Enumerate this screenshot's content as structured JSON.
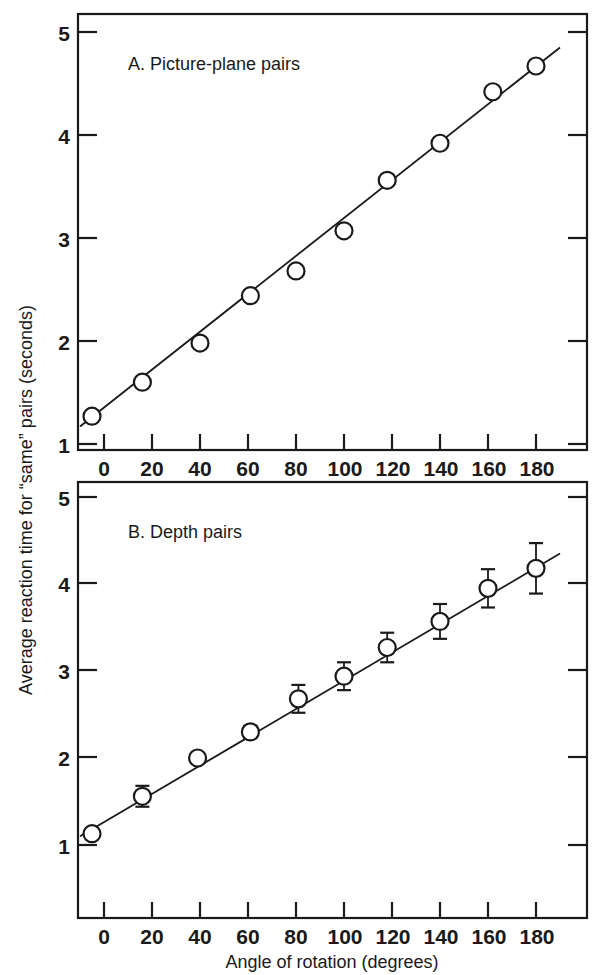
{
  "figure": {
    "background": "#ffffff",
    "ink_color": "#1a1a1a",
    "x_axis_label": "Angle of rotation (degrees)",
    "y_axis_label": "Average reaction time for “same” pairs (seconds)"
  },
  "chart_data": [
    {
      "type": "scatter",
      "panel": "A",
      "title": "A. Picture-plane pairs",
      "xlabel": "Angle of rotation (degrees)",
      "ylabel": "Average reaction time for “same” pairs (seconds)",
      "xlim": [
        -10,
        190
      ],
      "ylim": [
        1,
        5.2
      ],
      "xticks": [
        0,
        20,
        40,
        60,
        80,
        100,
        120,
        140,
        160,
        180
      ],
      "yticks": [
        1,
        2,
        3,
        4,
        5
      ],
      "grid": false,
      "legend": null,
      "marker": "open-circle",
      "has_error_bars": false,
      "x": [
        -5,
        16,
        40,
        61,
        80,
        100,
        118,
        140,
        162,
        180
      ],
      "values": [
        1.27,
        1.6,
        1.98,
        2.44,
        2.68,
        3.07,
        3.56,
        3.92,
        4.42,
        4.67
      ],
      "fit_line": {
        "x0": -10,
        "y0": 1.17,
        "x1": 190,
        "y1": 4.85
      }
    },
    {
      "type": "scatter",
      "panel": "B",
      "title": "B. Depth pairs",
      "xlabel": "Angle of rotation (degrees)",
      "ylabel": "Average reaction time for “same” pairs (seconds)",
      "xlim": [
        -10,
        190
      ],
      "ylim": [
        1,
        5.2
      ],
      "xticks": [
        0,
        20,
        40,
        60,
        80,
        100,
        120,
        140,
        160,
        180
      ],
      "yticks": [
        1,
        2,
        3,
        4,
        5
      ],
      "grid": false,
      "legend": null,
      "marker": "open-circle",
      "has_error_bars": true,
      "x": [
        -5,
        16,
        39,
        61,
        81,
        100,
        118,
        140,
        160,
        180
      ],
      "values": [
        1.13,
        1.56,
        2.0,
        2.3,
        2.68,
        2.94,
        3.27,
        3.57,
        3.95,
        4.18
      ],
      "errors": [
        0.0,
        0.12,
        0.0,
        0.07,
        0.16,
        0.16,
        0.17,
        0.2,
        0.22,
        0.29
      ],
      "fit_line": {
        "x0": -10,
        "y0": 1.1,
        "x1": 190,
        "y1": 4.35
      }
    }
  ],
  "panel_a": {
    "title": "A. Picture-plane pairs",
    "y_tick_labels": [
      "5",
      "4",
      "3",
      "2",
      "1"
    ],
    "x_tick_labels": [
      "0",
      "20",
      "40",
      "60",
      "80",
      "100",
      "120",
      "140",
      "160",
      "180"
    ]
  },
  "panel_b": {
    "title": "B. Depth pairs",
    "y_tick_labels": [
      "5",
      "4",
      "3",
      "2",
      "1"
    ],
    "x_tick_labels": [
      "0",
      "20",
      "40",
      "60",
      "80",
      "100",
      "120",
      "140",
      "160",
      "180"
    ]
  }
}
